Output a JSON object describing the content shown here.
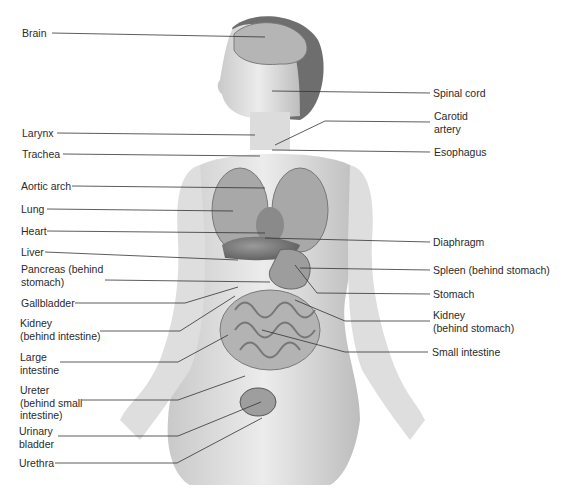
{
  "diagram": {
    "labels_left": [
      {
        "id": "brain",
        "text": "Brain",
        "x": 22,
        "y": 28
      },
      {
        "id": "larynx",
        "text": "Larynx",
        "x": 22,
        "y": 127
      },
      {
        "id": "trachea",
        "text": "Trachea",
        "x": 22,
        "y": 148
      },
      {
        "id": "aortic-arch",
        "text": "Aortic arch",
        "x": 21,
        "y": 181
      },
      {
        "id": "lung",
        "text": "Lung",
        "x": 21,
        "y": 203
      },
      {
        "id": "heart",
        "text": "Heart",
        "x": 21,
        "y": 225
      },
      {
        "id": "liver",
        "text": "Liver",
        "x": 21,
        "y": 246
      },
      {
        "id": "pancreas",
        "text": "Pancreas (behind\nstomach)",
        "x": 21,
        "y": 264
      },
      {
        "id": "gallbladder",
        "text": "Gallbladder",
        "x": 21,
        "y": 297
      },
      {
        "id": "kidney-left",
        "text": "Kidney\n(behind intestine)",
        "x": 20,
        "y": 317
      },
      {
        "id": "large-intestine",
        "text": "Large\nintestine",
        "x": 20,
        "y": 351
      },
      {
        "id": "ureter",
        "text": "Ureter\n(behind small\nintestine)",
        "x": 20,
        "y": 384
      },
      {
        "id": "urinary-bladder",
        "text": "Urinary\nbladder",
        "x": 19,
        "y": 426
      },
      {
        "id": "urethra",
        "text": "Urethra",
        "x": 19,
        "y": 457
      }
    ],
    "labels_right": [
      {
        "id": "spinal-cord",
        "text": "Spinal cord",
        "x": 433,
        "y": 88
      },
      {
        "id": "carotid-artery",
        "text": "Carotid\nartery",
        "x": 434,
        "y": 111
      },
      {
        "id": "esophagus",
        "text": "Esophagus",
        "x": 434,
        "y": 146
      },
      {
        "id": "diaphragm",
        "text": "Diaphragm",
        "x": 433,
        "y": 236
      },
      {
        "id": "spleen",
        "text": "Spleen (behind stomach)",
        "x": 433,
        "y": 264
      },
      {
        "id": "stomach",
        "text": "Stomach",
        "x": 433,
        "y": 288
      },
      {
        "id": "kidney-right",
        "text": "Kidney\n(behind stomach)",
        "x": 433,
        "y": 309
      },
      {
        "id": "small-intestine",
        "text": "Small intestine",
        "x": 432,
        "y": 346
      }
    ]
  }
}
